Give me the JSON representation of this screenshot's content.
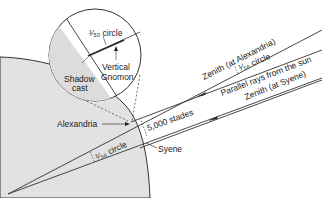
{
  "diagram": {
    "colors": {
      "earth_fill": "#e2e2e2",
      "inset_fill": "#ffffff",
      "inset_shade": "#dcdcdc",
      "line": "#333333"
    },
    "labels": {
      "inset_angle": "¹⁄₅₀ circle",
      "shadow_cast": [
        "Shadow",
        "cast"
      ],
      "vertical_gnomon": [
        "Vertical",
        "Gnomon"
      ],
      "alexandria": "Alexandria",
      "syene": "Syene",
      "distance": "5,000 stades",
      "center_angle": "¹⁄₅₀ circle",
      "zenith_alexandria": "Zenith (at Alexandria)",
      "zenith_syene": "Zenith (at Syene)",
      "ray_angle": "¹⁄₅₀ circle",
      "parallel_rays": "Parallel rays from the sun"
    }
  }
}
